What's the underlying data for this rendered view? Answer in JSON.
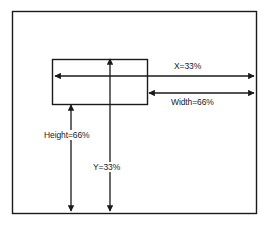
{
  "diagram": {
    "colors": {
      "stroke": "#1a1a1a",
      "background": "#ffffff",
      "text": "#1a1a1a"
    },
    "outer_frame": {
      "name": "outer-container-rectangle",
      "x": 12,
      "y": 11,
      "width": 245,
      "height": 203
    },
    "inner_box": {
      "name": "inner-element-rectangle",
      "x": 52,
      "y": 59,
      "width": 96,
      "height": 46
    },
    "measurements": [
      {
        "id": "x",
        "label": "X=33%",
        "value": 33,
        "unit": "%",
        "orientation": "horizontal",
        "arrow_heads": "both",
        "from": {
          "x": 54,
          "y": 76
        },
        "to": {
          "x": 255,
          "y": 76
        },
        "label_position": "above"
      },
      {
        "id": "width",
        "label": "Width=66%",
        "value": 66,
        "unit": "%",
        "orientation": "horizontal",
        "arrow_heads": "both",
        "from": {
          "x": 148,
          "y": 93
        },
        "to": {
          "x": 255,
          "y": 93
        },
        "label_position": "below"
      },
      {
        "id": "height",
        "label": "Height=66%",
        "value": 66,
        "unit": "%",
        "orientation": "vertical",
        "arrow_heads": "both",
        "from": {
          "x": 71,
          "y": 104
        },
        "to": {
          "x": 71,
          "y": 212
        },
        "label_position": "on-line"
      },
      {
        "id": "y",
        "label": "Y=33%",
        "value": 33,
        "unit": "%",
        "orientation": "vertical",
        "arrow_heads": "both",
        "from": {
          "x": 110,
          "y": 58
        },
        "to": {
          "x": 110,
          "y": 212
        },
        "label_position": "on-line"
      }
    ]
  }
}
